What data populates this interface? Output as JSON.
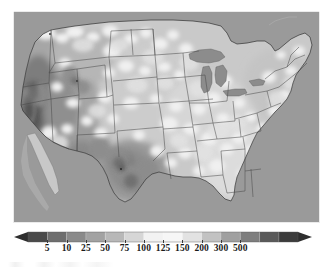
{
  "figure": {
    "type": "map",
    "title": "",
    "background_color": "#ffffff",
    "ocean_color": "#9a9a9a",
    "border_color": "#3c3c3c"
  },
  "map": {
    "name": "contiguous-united-states",
    "projection": "lambert-conformal-conic",
    "region_label": "Contiguous United States",
    "state_boundaries": true,
    "coastline": true,
    "great_lakes": true
  },
  "chart_data": {
    "type": "heatmap",
    "title": "",
    "xlabel": "",
    "ylabel": "",
    "colormap": "grayscale-inverted",
    "legend_position": "bottom",
    "grid": false,
    "tick_labels": [
      "5",
      "10",
      "25",
      "50",
      "75",
      "100",
      "125",
      "150",
      "200",
      "300",
      "500"
    ],
    "tick_values": [
      5,
      10,
      25,
      50,
      75,
      100,
      125,
      150,
      200,
      300,
      500
    ],
    "extend": "both",
    "segment_colors": [
      "#4a4a4a",
      "#6e6e6e",
      "#8a8a8a",
      "#a2a2a2",
      "#b8b8b8",
      "#d6d6d6",
      "#f2f2f2",
      "#f6f6f6",
      "#e2e2e2",
      "#c2c2c2",
      "#a0a0a0",
      "#7e7e7e",
      "#5a5a5a",
      "#3c3c3c"
    ],
    "under_color": "#2e2e2e",
    "over_color": "#2e2e2e"
  },
  "colorbar": {
    "name": "value-colorbar",
    "orientation": "horizontal",
    "left_arrow": true,
    "right_arrow": true
  }
}
